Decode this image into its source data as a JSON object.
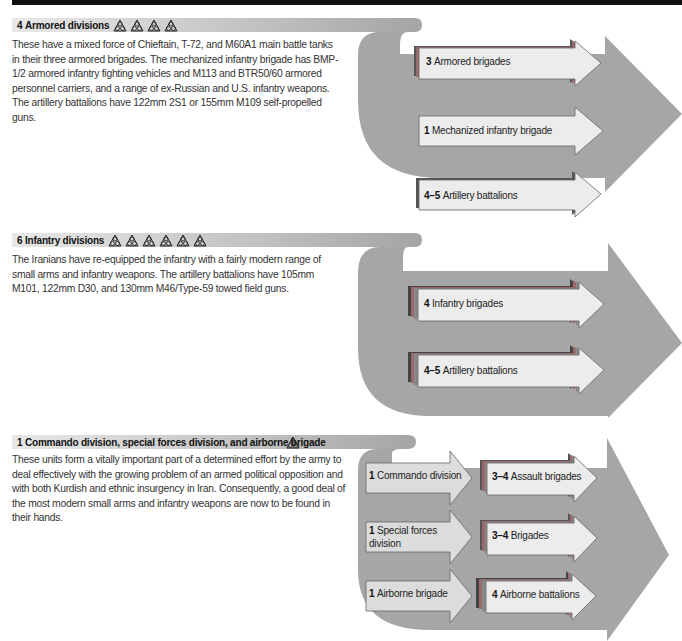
{
  "colors": {
    "big_arrow": "#a6a6a6",
    "small_arrow_fill": "#ececec",
    "small_arrow_fill_left": "#dcdcdc",
    "stack_dark": "#555555",
    "stack_red": "#9a6a6a",
    "stack_mid": "#888888",
    "topbar": "#111111"
  },
  "sections": [
    {
      "count": "4",
      "title": "Armored divisions",
      "icon": "division-triangle-icon",
      "icon_count": 4,
      "description": "These have a mixed force of Chieftain, T-72, and M60A1 main battle tanks in their three armored brigades. The mechanized infantry brigade has BMP-1/2 armored infantry fighting vehicles and M113 and BTR50/60 armored personnel carriers, and a range of ex-Russian and U.S. infantry weapons. The artillery battalions have 122mm 2S1 or 155mm M109 self-propelled guns.",
      "units": [
        {
          "count": "3",
          "label": "Armored brigades",
          "stacked": true
        },
        {
          "count": "1",
          "label": "Mechanized infantry brigade",
          "stacked": false
        },
        {
          "count": "4–5",
          "label": "Artillery battalions",
          "stacked": true
        }
      ]
    },
    {
      "count": "6",
      "title": "Infantry divisions",
      "icon": "division-triangle-icon",
      "icon_count": 6,
      "description": "The Iranians have re-equipped the infantry with a fairly modern range of small arms and infantry weapons. The artillery battalions have 105mm M101, 122mm D30, and 130mm M46/Type-59 towed field guns.",
      "units": [
        {
          "count": "4",
          "label": "Infantry brigades",
          "stacked": true
        },
        {
          "count": "4–5",
          "label": "Artillery battalions",
          "stacked": true
        }
      ]
    },
    {
      "count": "1",
      "title": "Commando division, special forces division, and airborne brigade",
      "icon": "division-triangle-icon",
      "icon_count": 1,
      "description": "These units form a vitally important part of a determined effort by the army to deal effectively with the growing problem of an armed political opposition and with both Kurdish and ethnic insurgency in Iran. Consequently, a good deal of the most modern small arms and infantry weapons are now to be found in their hands.",
      "rows": [
        {
          "parent_count": "1",
          "parent_label": "Commando division",
          "child_count": "3–4",
          "child_label": "Assault brigades"
        },
        {
          "parent_count": "1",
          "parent_label": "Special forces",
          "parent_label2": "division",
          "child_count": "3–4",
          "child_label": "Brigades"
        },
        {
          "parent_count": "1",
          "parent_label": "Airborne brigade",
          "child_count": "4",
          "child_label": "Airborne battalions"
        }
      ]
    }
  ]
}
